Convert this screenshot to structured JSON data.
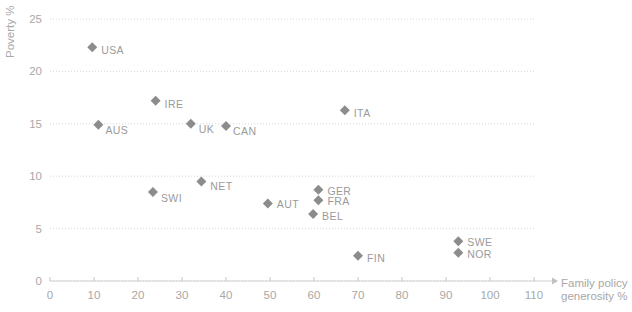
{
  "chart_data": {
    "type": "scatter",
    "title": "",
    "subtitle": "",
    "xlabel": "Family policy generosity %",
    "ylabel": "Poverty %",
    "xlim": [
      0,
      110
    ],
    "ylim": [
      0,
      25
    ],
    "xticks": [
      0,
      10,
      20,
      30,
      40,
      50,
      60,
      70,
      80,
      90,
      100,
      110
    ],
    "yticks": [
      0,
      5,
      10,
      15,
      20,
      25
    ],
    "xtick_labels": [
      "0",
      "10",
      "20",
      "30",
      "40",
      "50",
      "60",
      "70",
      "80",
      "90",
      "100",
      "110"
    ],
    "ytick_labels": [
      "0",
      "5",
      "10",
      "15",
      "20",
      "25"
    ],
    "grid": "horizontal-dotted",
    "legend": "none",
    "marker_shape": "diamond",
    "marker_color": "#8c8c8c",
    "grid_color": "#d8d8d8",
    "axis_color": "#c0c0c0",
    "label_color": "#9a9a9a",
    "points": [
      {
        "label": "USA",
        "x": 9.6,
        "y": 22.3,
        "label_dx": 9,
        "label_dy": 7
      },
      {
        "label": "IRE",
        "x": 24.0,
        "y": 17.2,
        "label_dx": 9,
        "label_dy": 7
      },
      {
        "label": "AUS",
        "x": 11.0,
        "y": 14.9,
        "label_dx": 7,
        "label_dy": 9
      },
      {
        "label": "UK",
        "x": 32.0,
        "y": 15.0,
        "label_dx": 8,
        "label_dy": 9
      },
      {
        "label": "CAN",
        "x": 40.0,
        "y": 14.8,
        "label_dx": 7,
        "label_dy": 9
      },
      {
        "label": "ITA",
        "x": 67.0,
        "y": 16.3,
        "label_dx": 9,
        "label_dy": 7
      },
      {
        "label": "NET",
        "x": 34.4,
        "y": 9.5,
        "label_dx": 9,
        "label_dy": 9
      },
      {
        "label": "SWI",
        "x": 23.4,
        "y": 8.5,
        "label_dx": 8,
        "label_dy": 10
      },
      {
        "label": "GER",
        "x": 61.0,
        "y": 8.7,
        "label_dx": 9,
        "label_dy": 5
      },
      {
        "label": "FRA",
        "x": 61.0,
        "y": 7.7,
        "label_dx": 9,
        "label_dy": 5
      },
      {
        "label": "AUT",
        "x": 49.5,
        "y": 7.4,
        "label_dx": 9,
        "label_dy": 5
      },
      {
        "label": "BEL",
        "x": 59.8,
        "y": 6.4,
        "label_dx": 9,
        "label_dy": 6
      },
      {
        "label": "SWE",
        "x": 92.8,
        "y": 3.8,
        "label_dx": 9,
        "label_dy": 5
      },
      {
        "label": "NOR",
        "x": 92.8,
        "y": 2.7,
        "label_dx": 9,
        "label_dy": 5
      },
      {
        "label": "FIN",
        "x": 70.0,
        "y": 2.4,
        "label_dx": 9,
        "label_dy": 6
      }
    ]
  },
  "axes": {
    "y_axis_title": "Poverty %",
    "x_axis_title_line1": "Family policy",
    "x_axis_title_line2": "generosity %"
  }
}
